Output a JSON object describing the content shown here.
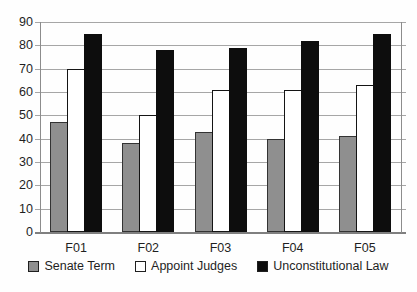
{
  "chart_data": {
    "type": "bar",
    "title": "",
    "xlabel": "",
    "ylabel": "",
    "categories": [
      "F01",
      "F02",
      "F03",
      "F04",
      "F05"
    ],
    "series": [
      {
        "name": "Senate Term",
        "values": [
          47,
          38,
          43,
          40,
          41
        ],
        "fill": "#8f8f8f",
        "border": "#333333"
      },
      {
        "name": "Appoint Judges",
        "values": [
          70,
          50,
          61,
          61,
          63
        ],
        "fill": "#ffffff",
        "border": "#141414"
      },
      {
        "name": "Unconstitutional Law",
        "values": [
          85,
          78,
          79,
          82,
          85
        ],
        "fill": "#0d0d0d",
        "border": "#0d0d0d"
      }
    ],
    "ylim": [
      0,
      90
    ],
    "y_tick_step": 10,
    "y_ticks": [
      "0",
      "10",
      "20",
      "30",
      "40",
      "50",
      "60",
      "70",
      "80",
      "90"
    ],
    "grid": true,
    "legend_position": "bottom"
  },
  "colors": {
    "background": "#fefefe",
    "gridline": "#a6a6a6",
    "axis": "#8c8c8c",
    "text": "#1f1f1f"
  }
}
